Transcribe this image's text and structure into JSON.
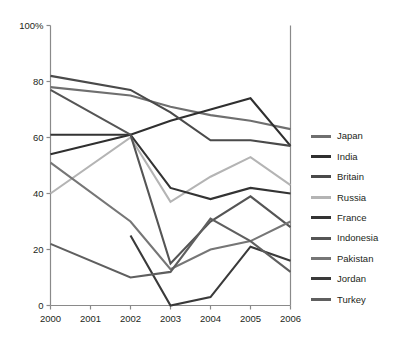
{
  "chart_data": {
    "type": "line",
    "title": "",
    "xlabel": "",
    "ylabel": "",
    "x": [
      "2000",
      "2001",
      "2002",
      "2003",
      "2004",
      "2005",
      "2006"
    ],
    "categories": [
      "2000",
      "2001",
      "2002",
      "2003",
      "2004",
      "2005",
      "2006"
    ],
    "ylim": [
      0,
      100
    ],
    "xlim": [
      2000,
      2006
    ],
    "y_ticks": [
      "0",
      "20",
      "40",
      "60",
      "80",
      "100%"
    ],
    "y_tick_values": [
      0,
      20,
      40,
      60,
      80,
      100
    ],
    "x_ticks": [
      "2000",
      "2001",
      "2002",
      "2003",
      "2004",
      "2005",
      "2006"
    ],
    "grid": false,
    "legend_position": "right",
    "series": [
      {
        "name": "Japan",
        "color": "#6f6f6f",
        "x": [
          "2000",
          "2002",
          "2003",
          "2004",
          "2005",
          "2006"
        ],
        "values": [
          78,
          75,
          71,
          68,
          66,
          63
        ]
      },
      {
        "name": "India",
        "color": "#2f2f2f",
        "x": [
          "2000",
          "2002",
          "2003",
          "2004",
          "2005",
          "2006"
        ],
        "values": [
          54,
          61,
          66,
          70,
          74,
          57
        ]
      },
      {
        "name": "Britain",
        "color": "#4a4a4a",
        "x": [
          "2000",
          "2002",
          "2003",
          "2004",
          "2005",
          "2006"
        ],
        "values": [
          82,
          77,
          69,
          59,
          59,
          57
        ]
      },
      {
        "name": "Russia",
        "color": "#b4b4b4",
        "x": [
          "2000",
          "2002",
          "2003",
          "2004",
          "2005",
          "2006"
        ],
        "values": [
          40,
          60,
          37,
          46,
          53,
          43
        ]
      },
      {
        "name": "France",
        "color": "#333333",
        "x": [
          "2000",
          "2002",
          "2003",
          "2004",
          "2005",
          "2006"
        ],
        "values": [
          61,
          61,
          42,
          38,
          42,
          40
        ]
      },
      {
        "name": "Indonesia",
        "color": "#555555",
        "x": [
          "2000",
          "2002",
          "2003",
          "2004",
          "2005",
          "2006"
        ],
        "values": [
          77,
          61,
          15,
          30,
          39,
          28
        ]
      },
      {
        "name": "Pakistan",
        "color": "#767676",
        "x": [
          "2000",
          "2002",
          "2003",
          "2004",
          "2005",
          "2006"
        ],
        "values": [
          51,
          30,
          13,
          20,
          23,
          30
        ]
      },
      {
        "name": "Jordan",
        "color": "#3a3a3a",
        "x": [
          "2002",
          "2003",
          "2004",
          "2005",
          "2006"
        ],
        "values": [
          25,
          0,
          3,
          21,
          16
        ]
      },
      {
        "name": "Turkey",
        "color": "#5f5f5f",
        "x": [
          "2000",
          "2002",
          "2003",
          "2004",
          "2005",
          "2006"
        ],
        "values": [
          22,
          10,
          12,
          31,
          23,
          12
        ]
      }
    ]
  },
  "legend": {
    "items": [
      {
        "label": "Japan",
        "color": "#6f6f6f"
      },
      {
        "label": "India",
        "color": "#2f2f2f"
      },
      {
        "label": "Britain",
        "color": "#4a4a4a"
      },
      {
        "label": "Russia",
        "color": "#b4b4b4"
      },
      {
        "label": "France",
        "color": "#333333"
      },
      {
        "label": "Indonesia",
        "color": "#555555"
      },
      {
        "label": "Pakistan",
        "color": "#767676"
      },
      {
        "label": "Jordan",
        "color": "#3a3a3a"
      },
      {
        "label": "Turkey",
        "color": "#5f5f5f"
      }
    ]
  },
  "axis": {
    "color": "#8a8a8a",
    "text_color": "#231f20"
  }
}
